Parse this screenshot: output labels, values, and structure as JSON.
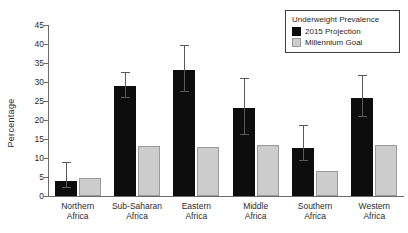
{
  "chart_data": {
    "type": "bar",
    "title": "",
    "xlabel": "",
    "ylabel": "Percentage",
    "ylim": [
      0,
      45
    ],
    "yticks": [
      0,
      5,
      10,
      15,
      20,
      25,
      30,
      35,
      40,
      45
    ],
    "grid": false,
    "legend_position": "top-right",
    "legend_title": "Underweight Prevalence",
    "categories": [
      "Northern Africa",
      "Sub-Saharan Africa",
      "Eastern Africa",
      "Middle Africa",
      "Southern Africa",
      "Western Africa"
    ],
    "category_lines": [
      [
        "Northern",
        "Africa"
      ],
      [
        "Sub-Saharan",
        "Africa"
      ],
      [
        "Eastern",
        "Africa"
      ],
      [
        "Middle",
        "Africa"
      ],
      [
        "Southern",
        "Africa"
      ],
      [
        "Western",
        "Africa"
      ]
    ],
    "series": [
      {
        "name": "2015 Projection",
        "color": "#0d0d0d",
        "values": [
          4.0,
          29.0,
          33.2,
          23.1,
          12.7,
          25.8
        ],
        "error_low": [
          2.0,
          25.7,
          27.3,
          16.0,
          9.2,
          20.7
        ],
        "error_high": [
          8.8,
          32.3,
          39.5,
          30.7,
          18.3,
          31.7
        ]
      },
      {
        "name": "Millennium Goal",
        "color": "#cccccc",
        "values": [
          4.7,
          13.1,
          13.0,
          13.5,
          6.7,
          13.5
        ],
        "error_low": [
          null,
          null,
          null,
          null,
          null,
          null
        ],
        "error_high": [
          null,
          null,
          null,
          null,
          null,
          null
        ]
      }
    ]
  },
  "legend": {
    "title": "Underweight Prevalence",
    "items": [
      {
        "label": "2015 Projection"
      },
      {
        "label": "Millennium Goal"
      }
    ]
  },
  "axes": {
    "y_title": "Percentage"
  }
}
